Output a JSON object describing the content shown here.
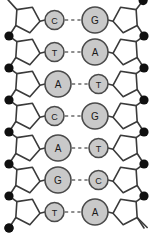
{
  "figure": {
    "name": "dna-double-helix-base-pairing-diagram",
    "width": 153,
    "height": 240,
    "background_color": "#ffffff"
  },
  "colors": {
    "stroke": "#3a3a3a",
    "sugar_fill": "#ffffff",
    "phosphate_fill": "#101010",
    "base_fill": "#c9c9c9",
    "base_stroke": "#4a4a4a",
    "label_color": "#1a1a1a",
    "hbond_color": "#6a6a6a"
  },
  "legend_semantics": {
    "pentagon": "deoxyribose-sugar",
    "filled_circle": "phosphate-group",
    "large_circle": "purine-base",
    "small_circle": "pyrimidine-base",
    "dashed_line": "hydrogen-bond"
  },
  "base_pairs": [
    {
      "index": 1,
      "y": 20,
      "left": {
        "letter": "C",
        "type": "pyrimidine",
        "size": "small"
      },
      "right": {
        "letter": "G",
        "type": "purine",
        "size": "large"
      }
    },
    {
      "index": 2,
      "y": 52,
      "left": {
        "letter": "T",
        "type": "pyrimidine",
        "size": "small"
      },
      "right": {
        "letter": "A",
        "type": "purine",
        "size": "large"
      }
    },
    {
      "index": 3,
      "y": 84,
      "left": {
        "letter": "A",
        "type": "purine",
        "size": "large"
      },
      "right": {
        "letter": "T",
        "type": "pyrimidine",
        "size": "small"
      }
    },
    {
      "index": 4,
      "y": 116,
      "left": {
        "letter": "C",
        "type": "pyrimidine",
        "size": "small"
      },
      "right": {
        "letter": "G",
        "type": "purine",
        "size": "large"
      }
    },
    {
      "index": 5,
      "y": 148,
      "left": {
        "letter": "A",
        "type": "purine",
        "size": "large"
      },
      "right": {
        "letter": "T",
        "type": "pyrimidine",
        "size": "small"
      }
    },
    {
      "index": 6,
      "y": 180,
      "left": {
        "letter": "G",
        "type": "purine",
        "size": "large"
      },
      "right": {
        "letter": "C",
        "type": "pyrimidine",
        "size": "small"
      }
    },
    {
      "index": 7,
      "y": 212,
      "left": {
        "letter": "T",
        "type": "pyrimidine",
        "size": "small"
      },
      "right": {
        "letter": "A",
        "type": "purine",
        "size": "large"
      }
    }
  ],
  "left_strand": {
    "name": "left-backbone",
    "sugar_x": 27,
    "phosphate_x": 9,
    "free_end_position": "top",
    "phosphate_count": 7
  },
  "right_strand": {
    "name": "right-backbone",
    "sugar_x": 126,
    "phosphate_x": 144,
    "free_end_position": "bottom",
    "phosphate_count": 7
  },
  "geometry": {
    "row_spacing": 32,
    "first_row_y": 20,
    "large_base_radius": 13,
    "small_base_radius": 9.5,
    "phosphate_radius": 4.6,
    "sugar_radius": 13
  }
}
